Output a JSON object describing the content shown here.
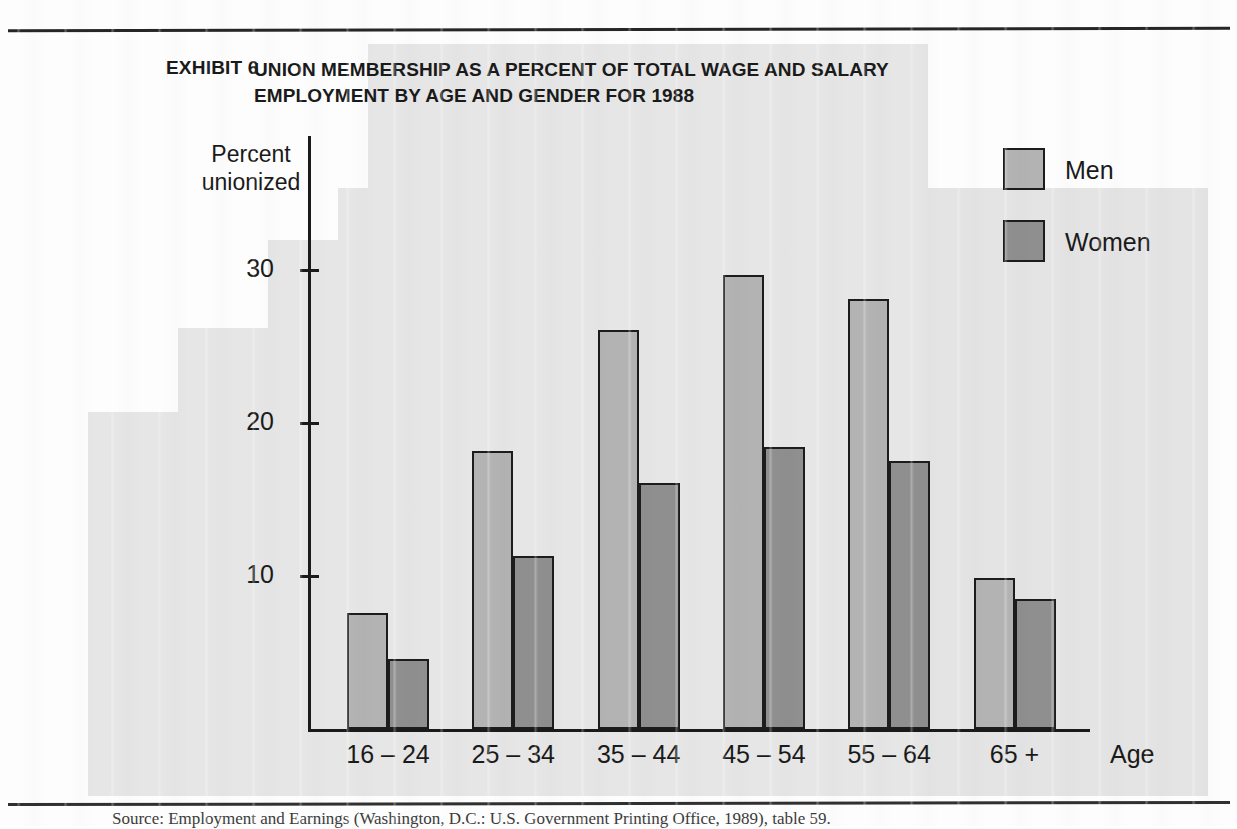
{
  "page": {
    "exhibit_number": "EXHIBIT 6",
    "title_line1": "UNION MEMBERSHIP AS A PERCENT OF TOTAL WAGE AND SALARY",
    "title_line2": "EMPLOYMENT BY AGE AND GENDER FOR 1988",
    "caption": "Source: Employment and Earnings (Washington, D.C.: U.S. Government Printing Office, 1989), table 59."
  },
  "colors": {
    "men_fill": "#b3b3b3",
    "women_fill": "#8f8f8f",
    "outline": "#1c1c1c",
    "panel": "#e6e6e6",
    "ink": "#1a1a1a"
  },
  "legend": {
    "position": "top-right",
    "entries": [
      {
        "label": "Men",
        "color": "#b3b3b3"
      },
      {
        "label": "Women",
        "color": "#8f8f8f"
      }
    ]
  },
  "axes": {
    "y_title_line1": "Percent",
    "y_title_line2": "unionized",
    "x_title": "Age",
    "y_ticks": [
      "10",
      "20",
      "30"
    ]
  },
  "chart_data": {
    "type": "bar",
    "title": "UNION MEMBERSHIP AS A PERCENT OF TOTAL WAGE AND SALARY EMPLOYMENT BY AGE AND GENDER FOR 1988",
    "xlabel": "Age",
    "ylabel": "Percent unionized",
    "ylim": [
      0,
      34
    ],
    "ytick_values": [
      10,
      20,
      30
    ],
    "grid": false,
    "legend_position": "top-right",
    "categories": [
      "16 – 24",
      "25 – 34",
      "35 – 44",
      "45 – 54",
      "55 – 64",
      "65 +"
    ],
    "series": [
      {
        "name": "Men",
        "color": "#b3b3b3",
        "values": [
          7.6,
          18.2,
          26.1,
          29.7,
          28.1,
          9.9
        ]
      },
      {
        "name": "Women",
        "color": "#8f8f8f",
        "values": [
          4.6,
          11.3,
          16.1,
          18.4,
          17.5,
          8.5
        ]
      }
    ]
  }
}
